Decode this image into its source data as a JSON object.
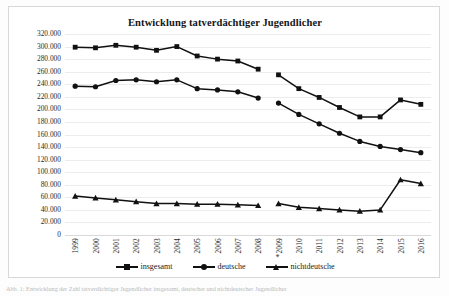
{
  "figure": {
    "title": "Entwicklung tatverdächtiger Jugendlicher",
    "caption": "Abb. 1: Entwicklung der Zahl tatverdächtiger Jugendlicher insgesamt, deutscher und nichtdeutscher Jugendlicher"
  },
  "legend": {
    "position": "bottom",
    "items": [
      {
        "label": "insgesamt",
        "marker": "square-marker-icon",
        "color": "#111111"
      },
      {
        "label": "deutsche",
        "marker": "circle-marker-icon",
        "color": "#111111"
      },
      {
        "label": "nichtdeutsche",
        "marker": "triangle-marker-icon",
        "color": "#111111"
      }
    ]
  },
  "axes": {
    "y_ticks": [
      "320.000",
      "300.000",
      "280.000",
      "260.000",
      "240.000",
      "220.000",
      "200.000",
      "180.000",
      "160.000",
      "140.000",
      "120.000",
      "100.000",
      "80.000",
      "60.000",
      "40.000",
      "20.000",
      "0"
    ],
    "x_ticks": [
      "1999",
      "2000",
      "2001",
      "2002",
      "2003",
      "2004",
      "2005",
      "2006",
      "2007",
      "2008",
      "*2009",
      "2010",
      "2011",
      "2012",
      "2013",
      "2014",
      "2015",
      "2016"
    ]
  },
  "chart_data": {
    "type": "line",
    "title": "Entwicklung tatverdächtiger Jugendlicher",
    "xlabel": "",
    "ylabel": "",
    "ylim": [
      0,
      320000
    ],
    "ytick_step": 20000,
    "grid": true,
    "legend_position": "bottom",
    "note": "Zeitreihenbruch zwischen 2008 und *2009; die Linien sind an dieser Stelle unterbrochen.",
    "categories": [
      "1999",
      "2000",
      "2001",
      "2002",
      "2003",
      "2004",
      "2005",
      "2006",
      "2007",
      "2008",
      "*2009",
      "2010",
      "2011",
      "2012",
      "2013",
      "2014",
      "2015",
      "2016"
    ],
    "series": [
      {
        "name": "insgesamt",
        "marker": "square",
        "values": [
          299000,
          298000,
          302000,
          299000,
          294000,
          300000,
          285000,
          280000,
          277000,
          264000,
          255000,
          233000,
          219000,
          203000,
          188000,
          188000,
          215000,
          208000
        ]
      },
      {
        "name": "deutsche",
        "marker": "circle",
        "values": [
          237000,
          236000,
          246000,
          247000,
          244000,
          247000,
          233000,
          231000,
          228000,
          218000,
          210000,
          192000,
          177000,
          162000,
          149000,
          141000,
          136000,
          131000
        ]
      },
      {
        "name": "nichtdeutsche",
        "marker": "triangle",
        "values": [
          62000,
          59000,
          56000,
          53000,
          50000,
          50000,
          49000,
          49000,
          48000,
          47000,
          50000,
          44000,
          42000,
          40000,
          38000,
          40000,
          88000,
          82000
        ]
      }
    ]
  }
}
